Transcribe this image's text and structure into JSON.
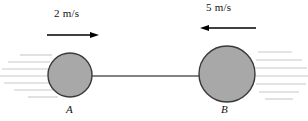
{
  "figure": {
    "type": "physics-diagram",
    "background_color": "#ffffff",
    "sphere_fill_color": "#a8a8a8",
    "sphere_stroke_color": "#3a3a3a",
    "rod_color": "#5a5a5a",
    "arrow_color": "#000000",
    "hatch_color": "#c9c9c9",
    "labels": {
      "speed_a": "2 m/s",
      "speed_b": "5 m/s",
      "body_a": "A",
      "body_b": "B"
    },
    "bodies": [
      {
        "name": "A",
        "label": "A",
        "center_x": 70,
        "center_y": 75,
        "radius": 22,
        "speed": "2 m/s",
        "direction": "right"
      },
      {
        "name": "B",
        "label": "B",
        "center_x": 227,
        "center_y": 74,
        "radius": 28,
        "speed": "5 m/s",
        "direction": "left"
      }
    ],
    "rod": {
      "x1": 92,
      "y1": 76,
      "x2": 199,
      "y2": 76
    },
    "arrows": [
      {
        "name": "velocity-arrow-a",
        "x1": 47,
        "y1": 35,
        "x2": 99,
        "y2": 35,
        "direction": "right",
        "label": "2 m/s"
      },
      {
        "name": "velocity-arrow-b",
        "x1": 256,
        "y1": 28,
        "x2": 200,
        "y2": 28,
        "direction": "left",
        "label": "5 m/s"
      }
    ],
    "hatching": {
      "left_line_count": 6,
      "right_line_count": 6
    }
  }
}
